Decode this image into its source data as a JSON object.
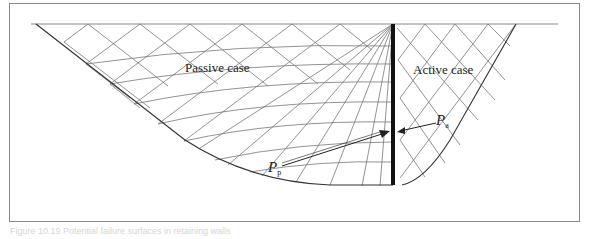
{
  "figure": {
    "labels": {
      "passive": "Passive case",
      "active": "Active case"
    },
    "forces": {
      "active": {
        "symbol": "P",
        "subscript": "a"
      },
      "passive": {
        "symbol": "P",
        "subscript": "p"
      }
    },
    "caption": "Figure 10.19  Potential failure surfaces in retaining walls"
  },
  "colors": {
    "grid_line": "#777777",
    "boundary": "#333333",
    "wall": "#111111",
    "frame": "#8a8a8a"
  }
}
